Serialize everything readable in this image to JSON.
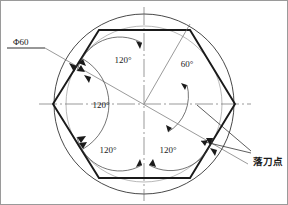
{
  "drawing": {
    "title": "Hexagon inscribed in circle - machining layout",
    "background_color": "#ffffff",
    "border_color": "#9a9a9a",
    "line_color": "#1a1a1a",
    "construction_color": "#6f6f6f",
    "centerline_color": "#6f6f6f",
    "center": {
      "x": 143,
      "y": 103
    },
    "circle": {
      "radius": 90
    },
    "inner_arc_radius": 78,
    "hexagon": {
      "vertices": [
        {
          "name": "right",
          "x": 234,
          "y": 103
        },
        {
          "name": "top-right",
          "x": 189,
          "y": 29
        },
        {
          "name": "top-left",
          "x": 98,
          "y": 29
        },
        {
          "name": "left",
          "x": 52,
          "y": 103
        },
        {
          "name": "bottom-left",
          "x": 98,
          "y": 177
        },
        {
          "name": "bottom-right",
          "x": 189,
          "y": 177
        }
      ]
    }
  },
  "labels": {
    "diameter": "Φ60",
    "angle_60": "60°",
    "angles_120": [
      {
        "id": "top-left-vertex",
        "text": "120°",
        "x": 122,
        "y": 59
      },
      {
        "id": "left-vertex",
        "text": "120°",
        "x": 100,
        "y": 104
      },
      {
        "id": "bottom-left-vertex",
        "text": "120°",
        "x": 103,
        "y": 149
      },
      {
        "id": "bottom-right-vertex",
        "text": "120°",
        "x": 161,
        "y": 150
      }
    ],
    "annotation_cjk": "落刀点"
  },
  "callouts": {
    "diameter_leader_start": {
      "x": 8,
      "y": 47
    },
    "diameter_leader_bend": {
      "x": 44,
      "y": 47
    },
    "annotation_anchor": {
      "x": 252,
      "y": 153
    }
  }
}
